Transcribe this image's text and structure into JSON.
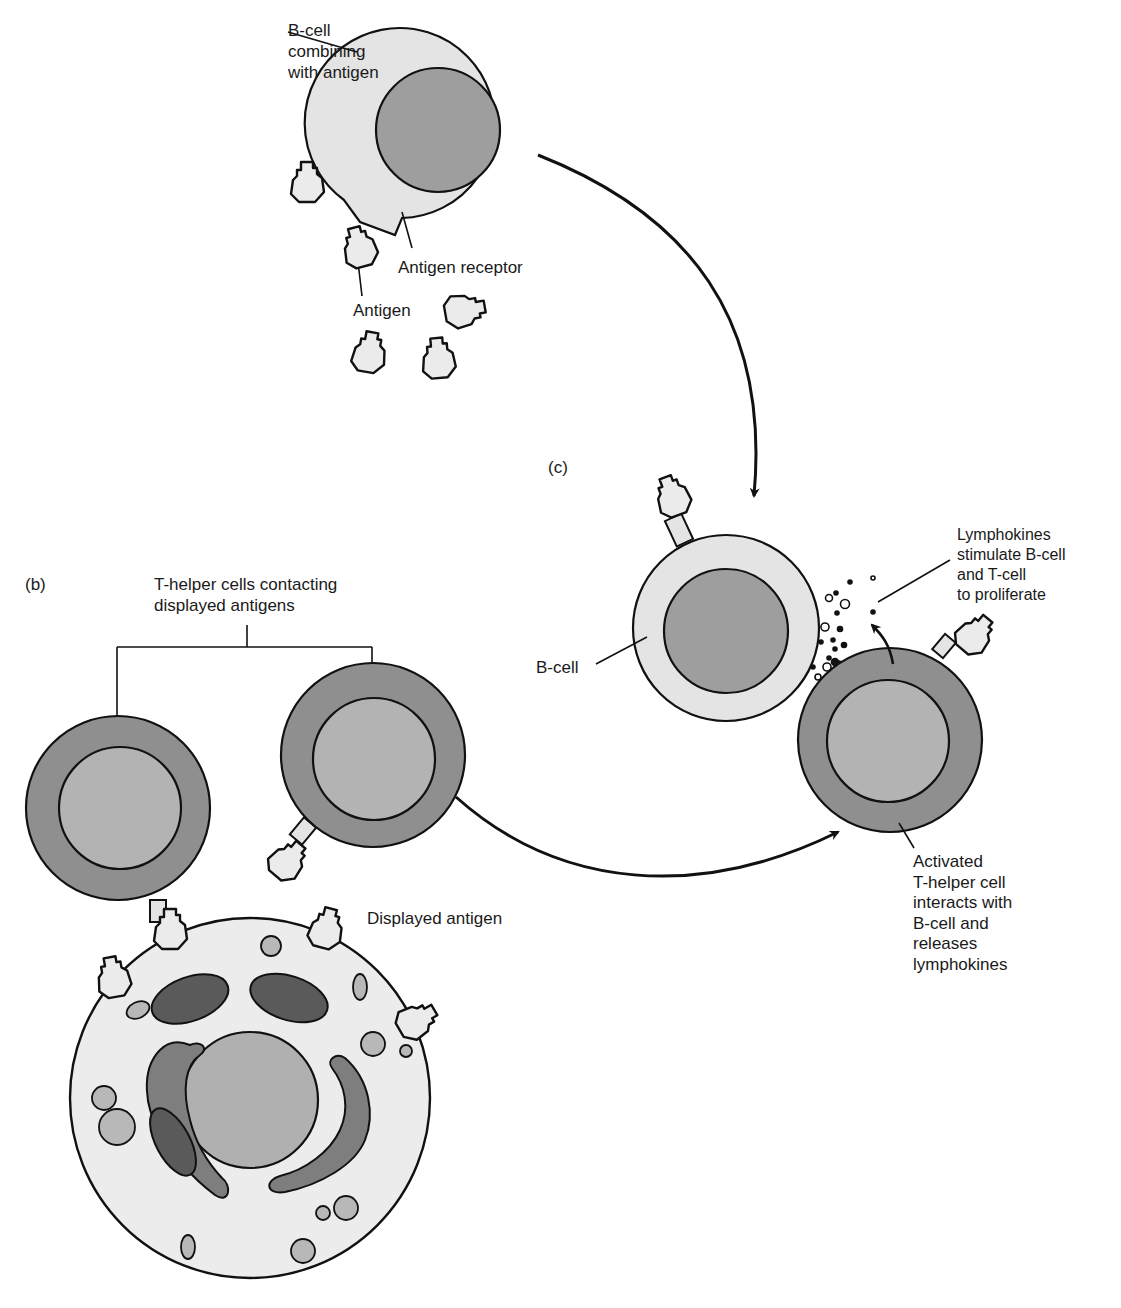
{
  "labels": {
    "bcell_combining": "B-cell\ncombining\nwith antigen",
    "antigen_receptor": "Antigen receptor",
    "antigen": "Antigen",
    "panel_c": "(c)",
    "panel_b": "(b)",
    "thelper_contacting": "T-helper cells contacting\ndisplayed antigens",
    "lymphokines": "Lymphokines\nstimulate B-cell\nand T-cell\nto proliferate",
    "bcell": "B-cell",
    "activated_thelper": "Activated\nT-helper cell\ninteracts with\nB-cell and\nreleases\nlymphokines",
    "displayed_antigen": "Displayed antigen"
  },
  "colors": {
    "bcell_outer": "#e4e4e4",
    "bcell_nucleus": "#9e9e9e",
    "thelper_outer": "#8f8f8f",
    "thelper_nucleus": "#b3b3b3",
    "apc_cytoplasm": "#ececec",
    "apc_nucleus": "#b0b0b0",
    "mitochondria": "#5a5a5a",
    "golgi": "#7e7e7e",
    "vesicle": "#b8b8b8",
    "antigen_fill": "#ebebeb",
    "stroke": "#111111"
  }
}
